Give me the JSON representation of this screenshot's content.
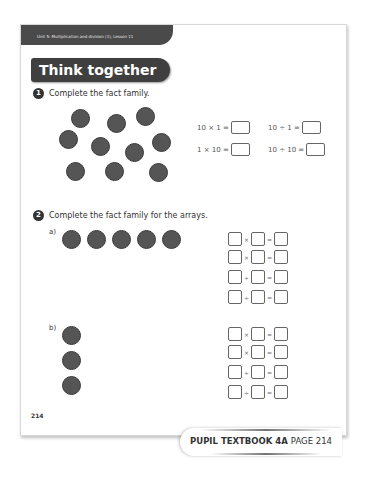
{
  "header": {
    "unit_label": "Unit 5: Multiplication and division (1), Lesson 11",
    "section_title": "Think together"
  },
  "question1": {
    "number": "1",
    "prompt": "Complete the fact family.",
    "counter_count": 10,
    "equations": [
      {
        "text": "10 × 1 ="
      },
      {
        "text": "10 ÷ 1 ="
      },
      {
        "text": "1 × 10 ="
      },
      {
        "text": "10 ÷ 10 ="
      }
    ]
  },
  "question2": {
    "number": "2",
    "prompt": "Complete the fact family for the arrays.",
    "parts": [
      {
        "label": "a)",
        "arrangement": "1 row of 5 counters",
        "operators": [
          "×",
          "×",
          "÷",
          "÷"
        ]
      },
      {
        "label": "b)",
        "arrangement": "1 column of 3 counters",
        "operators": [
          "×",
          "×",
          "÷",
          "÷"
        ]
      }
    ],
    "equals": "="
  },
  "page": {
    "number": "214"
  },
  "footer": {
    "book": "PUPIL TEXTBOOK 4A",
    "page_label": "PAGE 214"
  },
  "colors": {
    "header_bar": "#4a4a4a",
    "counter": "#555555",
    "text": "#333333"
  }
}
